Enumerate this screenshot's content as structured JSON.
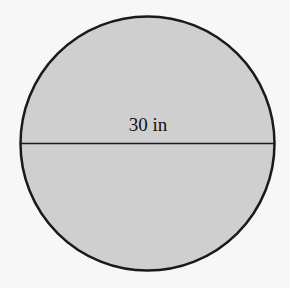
{
  "diagram": {
    "shape": "circle",
    "fill_color": "#cfcfcf",
    "stroke_color": "#1a1a1a",
    "background_color": "#f7f7f7",
    "diameter": {
      "label": "30 in",
      "value": 30,
      "unit": "in",
      "orientation": "horizontal"
    }
  }
}
